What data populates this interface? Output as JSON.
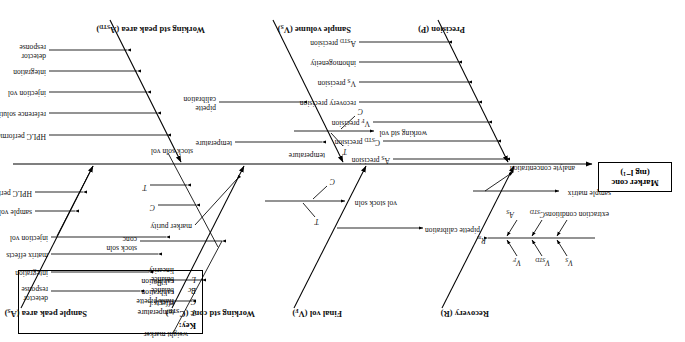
{
  "diagram": {
    "type": "fishbone-ishikawa",
    "orientation": "rotated-180",
    "head": {
      "line1": "Marker conc",
      "line2": "(mg l⁻¹)"
    },
    "key": {
      "title": "Key:",
      "entries": [
        {
          "symbol": "T",
          "meaning": "temperature effects"
        },
        {
          "symbol": "C",
          "meaning": "flask/pipette calibration"
        },
        {
          "symbol": "Bc",
          "meaning": "balance calibration"
        },
        {
          "symbol": "L",
          "meaning": "balance linearity"
        }
      ]
    },
    "branches_top": [
      {
        "name": "Precision (P)",
        "causes": [
          "A_STD precision",
          "inhomogeneity",
          "V_S precision",
          "recovery precision",
          "V_F precision",
          "C_STD precision",
          "A_S precision"
        ]
      },
      {
        "name": "Sample volume (V_S)",
        "causes": [
          "pipette calibration",
          "temperature"
        ]
      },
      {
        "name": "Working std peak area (A_STD)",
        "causes": [
          "HPLC performance",
          "reference solution conc",
          "injection vol",
          "integration",
          "detector response"
        ]
      }
    ],
    "branches_bottom": [
      {
        "name": "Recovery (R)",
        "causes": [
          "sample matrix",
          "analyte concentration",
          "R_m"
        ],
        "sub_top": [
          "V_S",
          "V_STD",
          "V_F"
        ],
        "sub_bottom": [
          "extraction conditions",
          "C_STD",
          "A_S"
        ]
      },
      {
        "name": "Final vol (V_F)",
        "causes": [
          "pipette calibration",
          "temperature"
        ]
      },
      {
        "name": "Working std conc (C_STD)",
        "causes": [
          "working std vol",
          "vol stock soln",
          "marker purity",
          "stock soln conc",
          "stock soln vol"
        ],
        "sub_marks": [
          "C",
          "T",
          "C",
          "T",
          "L",
          "Bc",
          "weight marker",
          "C",
          "T"
        ]
      },
      {
        "name": "Sample peak area (A_S)",
        "causes": [
          "HPLC performance",
          "sample vol",
          "injection vol",
          "matrix effects",
          "integration",
          "detector response"
        ]
      }
    ],
    "labels": {
      "precision_title": "Precision (P)",
      "sample_volume_title": "Sample volume (V",
      "sample_volume_sub": "S",
      "sample_volume_end": ")",
      "working_std_peak_title": "Working std peak area (A",
      "working_std_peak_sub": "STD",
      "working_std_peak_end": ")",
      "recovery_title": "Recovery (R)",
      "final_vol_title": "Final vol (V",
      "final_vol_sub": "F",
      "final_vol_end": ")",
      "working_std_conc_title": "Working std conc (C",
      "working_std_conc_sub": "STD",
      "working_std_conc_end": ")",
      "sample_peak_title": "Sample peak area (A",
      "sample_peak_sub": "S",
      "sample_peak_end": ")",
      "a_std_precision": "precision",
      "inhomogeneity": "inhomogeneity",
      "v_s_precision": "precision",
      "recovery_precision": "recovery precision",
      "v_f_precision": "precision",
      "c_std_precision": "precision",
      "a_s_precision": "precision",
      "pipette_calibration": "pipette",
      "pipette_calibration2": "calibration",
      "temperature": "temperature",
      "hplc_performance": "HPLC performance",
      "reference_solution_conc": "reference solution conc",
      "injection_vol": "injection vol",
      "integration": "integration",
      "detector": "detector",
      "response": "response",
      "sample_matrix": "sample matrix",
      "analyte_concentration": "analyte concentration",
      "extraction_conditions": "extraction conditions",
      "pipette_calibration_full": "pipette calibration",
      "working_std_vol": "working std vol",
      "vol_stock_soln": "vol stock soln",
      "marker_purity": "marker purity",
      "stock_soln_conc1": "stock soln",
      "stock_soln_conc2": "conc",
      "stock_soln_vol": "stock soln vol",
      "weight_marker": "weight marker",
      "sample_vol": "sample vol",
      "matrix_effects": "matrix effects",
      "sym_C": "C",
      "sym_T": "T",
      "sym_L": "L",
      "sym_Bc": "Bc",
      "sym_Rm": "R",
      "sym_Rm_sub": "m",
      "sym_VS": "V",
      "sym_VS_sub": "S",
      "sym_VSTD": "V",
      "sym_VSTD_sub": "STD",
      "sym_VF": "V",
      "sym_VF_sub": "F",
      "sym_AS": "A",
      "sym_AS_sub": "S",
      "sym_CSTD": "C",
      "sym_CSTD_sub": "STD",
      "sym_ASTD": "A",
      "sym_ASTD_sub": "STD"
    }
  }
}
